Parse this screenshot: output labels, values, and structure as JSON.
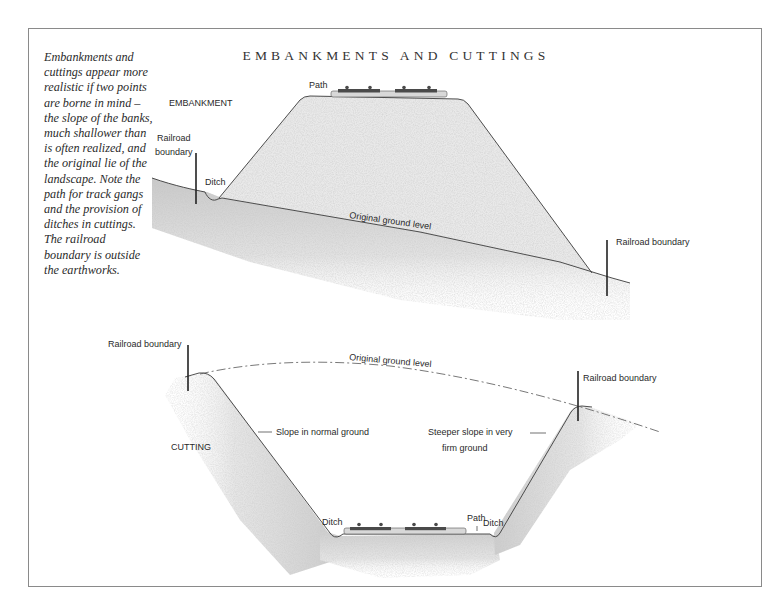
{
  "title": "EMBANKMENTS AND CUTTINGS",
  "caption": {
    "lines": [
      "Embankments and",
      "cuttings appear more",
      "realistic if two points",
      "are borne in mind –",
      "the slope of the banks,",
      "much shallower than",
      "is often realized, and",
      "the original lie of the",
      "landscape. Note the",
      "path for track gangs",
      "and the provision of",
      "ditches in cuttings.",
      "The railroad",
      "boundary is outside",
      "the earthworks."
    ]
  },
  "embankment": {
    "section_label": "EMBANKMENT",
    "path_label": "Path",
    "boundary_left_label_1": "Railroad",
    "boundary_left_label_2": "boundary",
    "ditch_label": "Ditch",
    "ground_label": "Original ground level",
    "boundary_right_label": "Railroad boundary"
  },
  "cutting": {
    "section_label": "CUTTING",
    "boundary_left_label": "Railroad boundary",
    "ground_label": "Original ground level",
    "boundary_right_label": "Railroad boundary",
    "slope_normal_label": "Slope in normal ground",
    "slope_steep_label_1": "Steeper  slope in very",
    "slope_steep_label_2": "firm ground",
    "ditch_left_label": "Ditch",
    "path_label": "Path",
    "ditch_right_label": "Ditch"
  },
  "colors": {
    "ink": "#2a2a2a",
    "fill_light": "#e4e4e4",
    "fill_dark": "#cfcfcf",
    "frame": "#8a8a8a"
  }
}
